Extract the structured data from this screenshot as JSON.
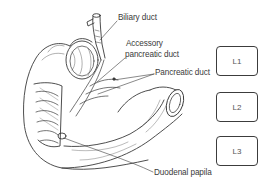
{
  "diagram": {
    "labels": {
      "biliary_duct": "Biliary duct",
      "accessory_line1": "Accessory",
      "accessory_line2": "pancreatic duct",
      "pancreatic_duct": "Pancreatic duct",
      "duodenal_papilla": "Duodenal papila"
    },
    "vertebral_levels": [
      {
        "label": "L1"
      },
      {
        "label": "L2"
      },
      {
        "label": "L3"
      }
    ],
    "colors": {
      "line": "#3a3a3a",
      "background": "#ffffff"
    }
  }
}
